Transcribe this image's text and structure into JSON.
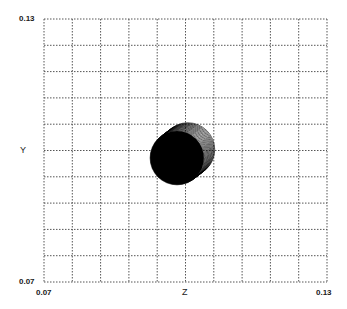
{
  "chart_data": {
    "type": "scatter",
    "title": "",
    "xlabel": "Z",
    "ylabel": "Y",
    "xlim": [
      0.07,
      0.13
    ],
    "ylim": [
      0.07,
      0.13
    ],
    "x_ticks": [
      "0.07",
      "0.13"
    ],
    "y_ticks": [
      "0.07",
      "0.13"
    ],
    "grid": {
      "on": true,
      "style": "dotted",
      "divisions_x": 10,
      "divisions_y": 10
    },
    "legend": null,
    "series": [
      {
        "name": "filled-disc",
        "shape": "filled circle",
        "color": "#000000",
        "center": {
          "z": 0.0982,
          "y": 0.0983
        },
        "radius": 0.0057
      },
      {
        "name": "swept-contour-rings",
        "shape": "stacked circle outlines",
        "color": "#000000",
        "from_center": {
          "z": 0.0982,
          "y": 0.0983
        },
        "to_center": {
          "z": 0.1005,
          "y": 0.1002
        },
        "radius": 0.0057
      }
    ]
  },
  "labels": {
    "x_axis": "Z",
    "y_axis": "Y",
    "x_min": "0.07",
    "x_max": "0.13",
    "y_min": "0.07",
    "y_max": "0.13"
  },
  "colors": {
    "grid": "#555555",
    "disc": "#000000",
    "background": "#ffffff"
  }
}
